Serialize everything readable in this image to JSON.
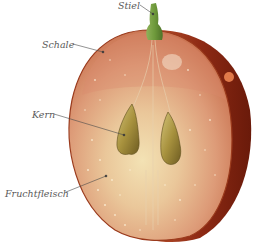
{
  "diagram": {
    "labels": [
      {
        "id": "stiel",
        "text": "Stiel",
        "x": 118,
        "y": 1
      },
      {
        "id": "schale",
        "text": "Schale",
        "x": 42,
        "y": 40
      },
      {
        "id": "kern",
        "text": "Kern",
        "x": 32,
        "y": 110
      },
      {
        "id": "fruchtfleisch",
        "text": "Fruchtfleisch",
        "x": 5,
        "y": 189
      }
    ],
    "colors": {
      "skin_outer": "#8e2a14",
      "skin_dark": "#6e1c0c",
      "flesh_light": "#f0d6a8",
      "flesh_mid": "#e0a47c",
      "flesh_pink": "#d98a6c",
      "stem": "#6f9a3c",
      "seed": "#a89340",
      "leader_line": "#4a4a4a"
    }
  }
}
